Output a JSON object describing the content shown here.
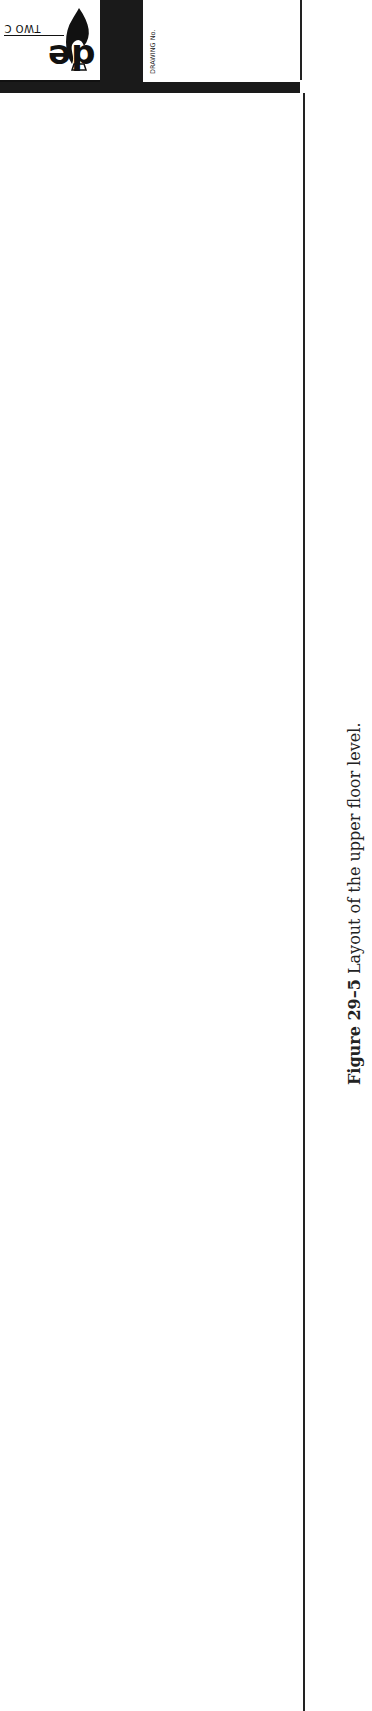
{
  "title_block": {
    "logo": {
      "main_text": "de",
      "sub_text": "TWO C",
      "icon": "flame-icon"
    },
    "drawing_no_label": "DRAWING No."
  },
  "caption": {
    "figure_label": "Figure 29–5",
    "text": "Layout of the upper floor level."
  },
  "colors": {
    "ink": "#1a1a1a",
    "paper": "#ffffff"
  }
}
